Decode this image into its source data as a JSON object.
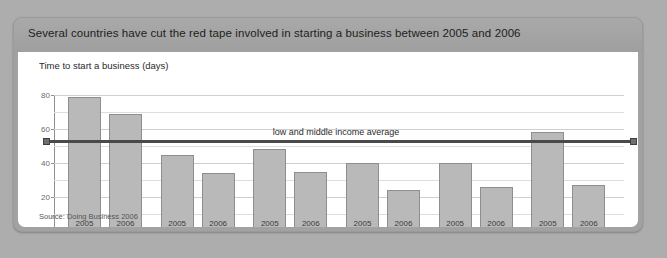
{
  "figure": {
    "title": "Several countries have cut the red tape involved in starting a business between 2005 and 2006",
    "subtitle": "Time to start a business (days)",
    "source": "Source: Doing Business 2006"
  },
  "chart_data": {
    "type": "bar",
    "title": "Several countries have cut the red tape involved in starting a business between 2005 and 2006",
    "subtitle": "Time to start a business (days)",
    "xlabel": "",
    "ylabel": "Time to start a business (days)",
    "ylim": [
      0,
      80
    ],
    "yticks": [
      0,
      20,
      40,
      60,
      80
    ],
    "ytick_labels": [
      "0",
      "20",
      "40",
      "60",
      "80"
    ],
    "minor_gridlines": [
      10,
      30,
      50,
      70
    ],
    "grid": true,
    "legend_position": "none",
    "categories": [
      "Belarus",
      "Burkina Faso",
      "China",
      "Czech Republic",
      "El Salvador",
      "Mexico"
    ],
    "series": [
      {
        "name": "2005",
        "values": [
          79,
          45,
          48,
          40,
          40,
          58
        ]
      },
      {
        "name": "2006",
        "values": [
          69,
          34,
          35,
          24,
          26,
          27
        ]
      }
    ],
    "annotations": [
      {
        "type": "hline",
        "label": "low and middle income average",
        "value": 53,
        "label_x_category_index": 3
      }
    ],
    "source": "Source: Doing Business 2006"
  }
}
